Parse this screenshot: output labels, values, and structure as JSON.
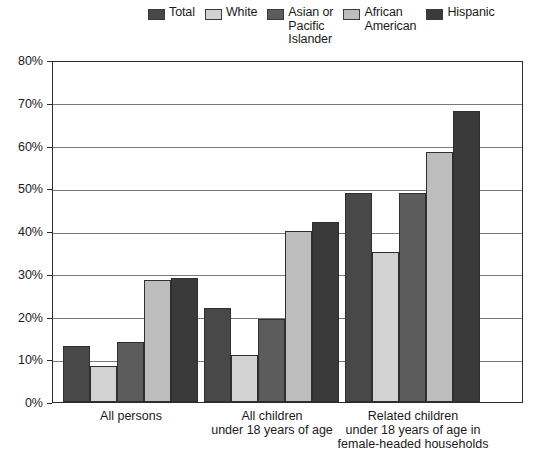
{
  "chart_data": {
    "type": "bar",
    "title": "",
    "subtitle": "",
    "xlabel": "",
    "ylabel": "",
    "ylim": [
      0,
      80
    ],
    "ytick_labels": [
      "0%",
      "10%",
      "20%",
      "30%",
      "40%",
      "50%",
      "60%",
      "70%",
      "80%"
    ],
    "ytick_values": [
      0,
      10,
      20,
      30,
      40,
      50,
      60,
      70,
      80
    ],
    "grid": true,
    "legend_position": "top",
    "categories": [
      "All persons",
      "All children\nunder 18 years of age",
      "Related children\nunder 18 years of age in\nfemale-headed households"
    ],
    "series": [
      {
        "name": "Total",
        "color": "#484848",
        "values": [
          13.0,
          22.0,
          49.0
        ]
      },
      {
        "name": "White",
        "color": "#d2d2d2",
        "values": [
          8.5,
          11.0,
          35.0
        ]
      },
      {
        "name": "Asian or\nPacific\nIslander",
        "color": "#5c5c5c",
        "values": [
          14.0,
          19.5,
          49.0
        ]
      },
      {
        "name": "African\nAmerican",
        "color": "#bdbdbd",
        "values": [
          28.5,
          40.0,
          58.5
        ]
      },
      {
        "name": "Hispanic",
        "color": "#3a3a3a",
        "values": [
          29.0,
          42.0,
          68.0
        ]
      }
    ]
  },
  "legend": {
    "items": [
      {
        "label": "Total",
        "swatch_color": "#484848"
      },
      {
        "label": "White",
        "swatch_color": "#d2d2d2"
      },
      {
        "label": "Asian or\nPacific\nIslander",
        "swatch_color": "#5c5c5c"
      },
      {
        "label": "African\nAmerican",
        "swatch_color": "#bdbdbd"
      },
      {
        "label": "Hispanic",
        "swatch_color": "#3a3a3a"
      }
    ]
  },
  "yaxis": {
    "labels": [
      "80%",
      "70%",
      "60%",
      "50%",
      "40%",
      "30%",
      "20%",
      "10%",
      "0%"
    ]
  },
  "xaxis": {
    "labels": [
      "All persons",
      "All children\nunder 18 years of age",
      "Related children\nunder 18 years of age in\nfemale-headed households"
    ]
  }
}
